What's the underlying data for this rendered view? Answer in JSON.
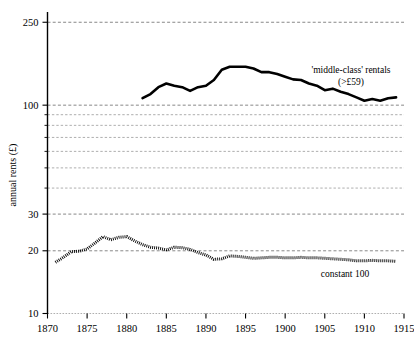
{
  "chart_data": {
    "type": "line",
    "title": "",
    "subtitle": "",
    "xlabel": "",
    "ylabel": "annual rents (£)",
    "yscale": "log",
    "ylim": [
      10,
      280
    ],
    "xlim": [
      1870,
      1915
    ],
    "grid": true,
    "legend_position": "inline-annotation",
    "x_ticks_major": [
      1870,
      1875,
      1880,
      1885,
      1890,
      1895,
      1900,
      1905,
      1910,
      1915
    ],
    "x_tick_labels": [
      "1870",
      "1875",
      "1880",
      "1885",
      "1890",
      "1895",
      "1900",
      "1905",
      "1910",
      "1915"
    ],
    "y_ticks_major": [
      10,
      20,
      30,
      100,
      250
    ],
    "y_tick_labels": [
      "10",
      "20",
      "30",
      "100",
      "250"
    ],
    "y_gridlines_minor": [
      40,
      50,
      60,
      70,
      80,
      90
    ],
    "annotations": [
      {
        "name": "middle-class-rentals-label",
        "line1": "'middle-class' rentals",
        "line2": "(>£59)",
        "x": 351,
        "y1": 73,
        "y2": 85
      },
      {
        "name": "constant-100-label",
        "line1": "constant 100",
        "x": 345,
        "y1": 277
      }
    ],
    "series": [
      {
        "name": "'middle-class' rentals (>£59)",
        "style": "solid",
        "x": [
          1882,
          1883,
          1884,
          1885,
          1886,
          1887,
          1888,
          1889,
          1890,
          1891,
          1892,
          1893,
          1894,
          1895,
          1896,
          1897,
          1898,
          1899,
          1900,
          1901,
          1902,
          1903,
          1904,
          1905,
          1906,
          1907,
          1908,
          1909,
          1910,
          1911,
          1912,
          1913,
          1914
        ],
        "values": [
          108,
          113,
          122,
          127,
          124,
          122,
          117,
          122,
          124,
          132,
          148,
          153,
          153,
          153,
          150,
          144,
          144,
          141,
          137,
          133,
          132,
          127,
          124,
          118,
          120,
          116,
          113,
          109,
          105,
          107,
          105,
          108,
          109
        ]
      },
      {
        "name": "constant 100",
        "style": "dotted",
        "x": [
          1871,
          1872,
          1873,
          1874,
          1875,
          1876,
          1877,
          1878,
          1879,
          1880,
          1881,
          1882,
          1883,
          1884,
          1885,
          1886,
          1887,
          1888,
          1889,
          1890,
          1891,
          1892,
          1893,
          1894,
          1895,
          1896,
          1897,
          1898,
          1899,
          1900,
          1901,
          1902,
          1903,
          1904,
          1905,
          1906,
          1907,
          1908,
          1909,
          1910,
          1911,
          1912,
          1913,
          1914
        ],
        "values": [
          17.6,
          18.6,
          19.8,
          19.9,
          20.4,
          21.8,
          23.4,
          22.6,
          23.2,
          23.4,
          22.3,
          21.4,
          20.8,
          20.6,
          20.2,
          20.8,
          20.7,
          20.3,
          19.6,
          19.1,
          18.2,
          18.3,
          18.9,
          18.8,
          18.6,
          18.4,
          18.5,
          18.6,
          18.6,
          18.5,
          18.5,
          18.6,
          18.5,
          18.5,
          18.4,
          18.3,
          18.2,
          18.1,
          17.9,
          17.9,
          18.0,
          17.9,
          17.9,
          17.8
        ]
      }
    ]
  },
  "figure": {
    "background_color": "#ffffff",
    "ink_color": "#000000",
    "grid_color": "#555555"
  }
}
